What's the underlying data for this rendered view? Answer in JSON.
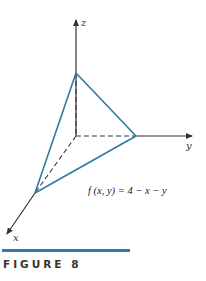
{
  "figure": {
    "caption": "FIGURE 8",
    "formula": "f (x, y) = 4 − x − y",
    "axes": {
      "x_label": "x",
      "y_label": "y",
      "z_label": "z"
    },
    "colors": {
      "surface_edges": "#2e7aa6",
      "axes": "#333333",
      "caption_bar": "#2e7aa6"
    },
    "intercepts": {
      "x": 4,
      "y": 4,
      "z": 4
    }
  }
}
